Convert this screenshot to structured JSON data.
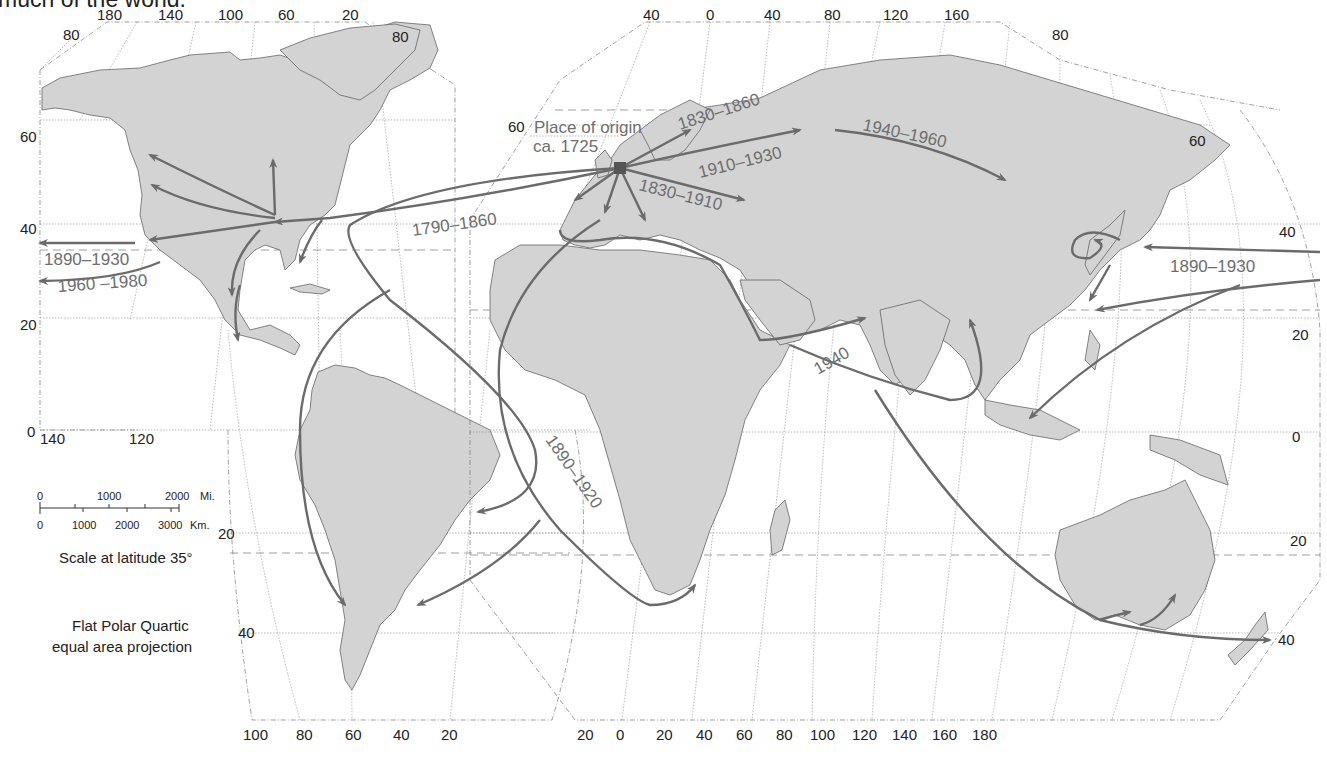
{
  "caption": "much of the world.",
  "map": {
    "projection": {
      "line1": "Flat Polar Quartic",
      "line2": "equal area projection"
    },
    "origin": {
      "label_line1": "Place of origin",
      "label_line2": "ca. 1725",
      "marker_color": "#555555"
    },
    "routes": [
      {
        "id": "route-1790-1860",
        "label": "1790–1860"
      },
      {
        "id": "route-1830-1860",
        "label": "1830–1860"
      },
      {
        "id": "route-1910-1930",
        "label": "1910–1930"
      },
      {
        "id": "route-1830-1910",
        "label": "1830–1910"
      },
      {
        "id": "route-1940-1960",
        "label": "1940–1960"
      },
      {
        "id": "route-1890-1930-west",
        "label": "1890–1930"
      },
      {
        "id": "route-1960-1980",
        "label": "1960 –1980"
      },
      {
        "id": "route-1890-1920",
        "label": "1890–1920"
      },
      {
        "id": "route-1940",
        "label": "1940"
      },
      {
        "id": "route-1890-1930-east",
        "label": "1890–1930"
      }
    ],
    "scale": {
      "miles_ticks": [
        "0",
        "1000",
        "2000"
      ],
      "miles_unit": "Mi.",
      "km_ticks": [
        "0",
        "1000",
        "2000",
        "3000"
      ],
      "km_unit": "Km.",
      "note": "Scale at latitude 35°"
    },
    "americas_panel": {
      "top_longitudes": [
        "180",
        "140",
        "100",
        "60",
        "20"
      ],
      "top_lat_left": "80",
      "top_lat_right": "80",
      "left_latitudes": [
        "60",
        "40",
        "20",
        "0"
      ],
      "lower_longitudes": [
        "140",
        "120"
      ],
      "south_latitudes": [
        "20",
        "40"
      ],
      "bottom_longitudes": [
        "100",
        "80",
        "60",
        "40",
        "20"
      ]
    },
    "eastern_panel": {
      "top_longitudes": [
        "40",
        "0",
        "40",
        "80",
        "120",
        "160"
      ],
      "top_lat_right": "80",
      "left_lat": "60",
      "right_latitudes": [
        "60",
        "40",
        "20",
        "0",
        "20",
        "40"
      ],
      "bottom_longitudes": [
        "20",
        "0",
        "20",
        "40",
        "60",
        "80",
        "100",
        "120",
        "140",
        "160",
        "180"
      ]
    },
    "colors": {
      "land": "#d3d3d3",
      "route": "#6b6b6b",
      "label": "#6e6e6e",
      "grid": "#888888"
    }
  }
}
